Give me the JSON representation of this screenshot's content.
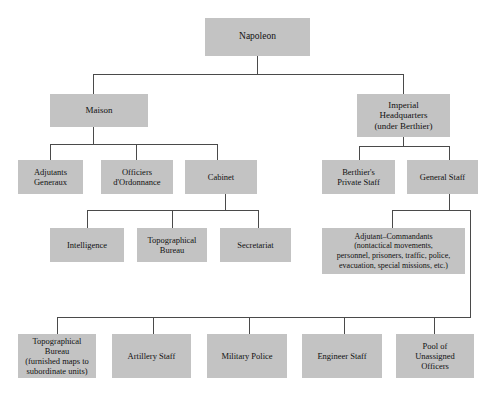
{
  "chart": {
    "type": "org-chart",
    "box_color": "#c3c3c3",
    "line_color": "#4a4a4a",
    "background_color": "#ffffff",
    "nodes": {
      "napoleon": "Napoleon",
      "maison": "Maison",
      "imperial_hq": "Imperial\nHeadquarters\n(under Berthier)",
      "adjutants_generaux": "Adjutants\nGeneraux",
      "officiers_ordonnance": "Officiers\nd'Ordonnance",
      "cabinet": "Cabinet",
      "berthiers_private_staff": "Berthier's\nPrivate Staff",
      "general_staff": "General Staff",
      "intelligence": "Intelligence",
      "topographical_bureau_cabinet": "Topographical\nBureau",
      "secretariat": "Secretariat",
      "adjutant_commandants": "Adjutant–Commandants\n(nontactical movements,\npersonnel, prisoners, traffic, police,\nevacuation, special missions, etc.)",
      "topographical_bureau_gs": "Topographical\nBureau\n(furnished maps to\nsubordinate units)",
      "artillery_staff": "Artillery Staff",
      "military_police": "Military Police",
      "engineer_staff": "Engineer Staff",
      "pool_unassigned_officers": "Pool of\nUnassigned\nOfficers"
    },
    "hierarchy": {
      "napoleon": [
        "maison",
        "imperial_hq"
      ],
      "maison": [
        "adjutants_generaux",
        "officiers_ordonnance",
        "cabinet"
      ],
      "cabinet": [
        "intelligence",
        "topographical_bureau_cabinet",
        "secretariat"
      ],
      "imperial_hq": [
        "berthiers_private_staff",
        "general_staff"
      ],
      "general_staff": [
        "adjutant_commandants",
        "topographical_bureau_gs",
        "artillery_staff",
        "military_police",
        "engineer_staff",
        "pool_unassigned_officers"
      ]
    }
  }
}
